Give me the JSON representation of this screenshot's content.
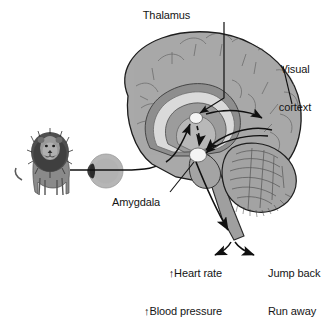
{
  "labels": {
    "thalamus": "Thalamus",
    "visual_cortex": "Visual\ncortext",
    "visual_cortex_line1": "Visual",
    "visual_cortex_line2": "cortext",
    "amygdala": "Amygdala",
    "autonomic_line1": "↑Heart rate",
    "autonomic_line2": "↑Blood pressure",
    "behavior_line1": "Jump back",
    "behavior_line2": "Run away"
  },
  "elements": {
    "stimulus": "lion",
    "eye": "eye",
    "optic_nerve": "optic-nerve",
    "brain": "brain-sagittal-section",
    "cerebellum": "cerebellum",
    "brainstem": "brainstem",
    "thalamus_node": "thalamus-node",
    "amygdala_node": "amygdala-node",
    "low_road_arrow": "dashed-thalamus-to-amygdala",
    "high_road_arrow": "thalamus-to-visual-cortex",
    "cortex_to_amygdala_arrow": "visual-cortex-to-amygdala",
    "output_arrow": "amygdala-output-arrow",
    "branch_arrows": "output-branch-arrows"
  },
  "colors": {
    "background": "#ffffff",
    "cortex_grey": "#a9a9a9",
    "cortex_outline": "#1d1d1d",
    "corpus_callosum_light": "#d9d9d9",
    "inner_mid_grey": "#8d8d8d",
    "deep_grey": "#777777",
    "node_white": "#f2f2f2",
    "lion_dark": "#4a4a4a",
    "lion_mid": "#707070",
    "eye_grey": "#b4b4b4",
    "eye_lens_dark": "#3a3a3a",
    "arrow_black": "#101010",
    "text": "#151515"
  }
}
